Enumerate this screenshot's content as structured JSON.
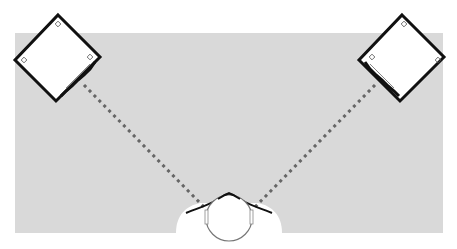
{
  "diagram": {
    "colors": {
      "background": "#ffffff",
      "room": "#d9d9d9",
      "outline": "#111111",
      "dotted_line": "#666666",
      "speaker_fill": "#ffffff",
      "head_fill": "#ffffff"
    },
    "elements": [
      {
        "id": "room-area",
        "label": "listening room area"
      },
      {
        "id": "left-speaker",
        "label": "left speaker (angled toward listener)"
      },
      {
        "id": "right-speaker",
        "label": "right speaker (angled toward listener)"
      },
      {
        "id": "left-sound-path",
        "label": "sound path left speaker to listener"
      },
      {
        "id": "right-sound-path",
        "label": "sound path right speaker to listener"
      },
      {
        "id": "listener",
        "label": "listener head with shoulders (top view)"
      }
    ]
  }
}
